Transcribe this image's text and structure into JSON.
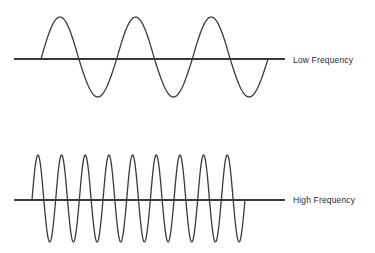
{
  "figure": {
    "background_color": "#ffffff",
    "stroke_color": "#3a3a3a",
    "axis_color": "#3a3a3a",
    "text_color": "#2b2b2b"
  },
  "waves": [
    {
      "id": "low-frequency",
      "label": "Low Frequency",
      "cycles": 3,
      "axis_y": 59,
      "axis_x_start": 14,
      "axis_x_end": 285,
      "wave_x_start": 41,
      "wave_x_end": 268,
      "amplitude_up": 42,
      "amplitude_down": 38,
      "stroke_width": 1.3,
      "axis_stroke_width": 2.2
    },
    {
      "id": "high-frequency",
      "label": "High Frequency",
      "cycles": 9,
      "axis_y": 200,
      "axis_x_start": 14,
      "axis_x_end": 285,
      "wave_x_start": 32,
      "wave_x_end": 245,
      "amplitude_up": 45,
      "amplitude_down": 42,
      "stroke_width": 1.3,
      "axis_stroke_width": 2.2
    }
  ],
  "chart_data": {
    "type": "line",
    "xlabel": "",
    "ylabel": "",
    "grid": false,
    "legend_position": "right",
    "series": [
      {
        "name": "Low Frequency",
        "waveform": "sine",
        "cycles": 3,
        "amplitude": 1.0,
        "phase": 0,
        "x_range": [
          41,
          268
        ],
        "baseline_y": 59
      },
      {
        "name": "High Frequency",
        "waveform": "sine",
        "cycles": 9,
        "amplitude": 1.0,
        "phase": 0,
        "x_range": [
          32,
          245
        ],
        "baseline_y": 200
      }
    ]
  }
}
